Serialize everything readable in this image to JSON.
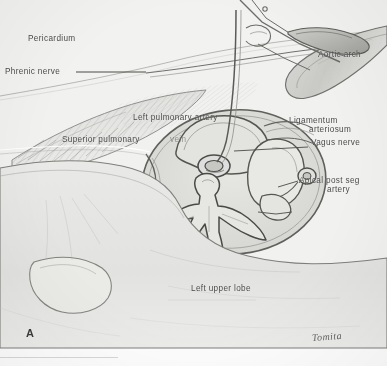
{
  "figure": {
    "panel_letter": "A",
    "signature": "Tomita",
    "medium": "pencil drawing, scanned halftone plate",
    "background_color": "#efefed",
    "ink_color": "#3c3c3c",
    "label_color": "#4a4a4a"
  },
  "labels": [
    {
      "id": "pericardium",
      "text": "Pericardium",
      "x": 28,
      "y": 34
    },
    {
      "id": "phrenic-nerve",
      "text": "Phrenic nerve",
      "x": 5,
      "y": 69
    },
    {
      "id": "aortic-arch",
      "text": "Aortic arch",
      "x": 318,
      "y": 53
    },
    {
      "id": "left-pulmonary-artery",
      "text": "Left pulmonary artery",
      "x": 133,
      "y": 114
    },
    {
      "id": "superior-pulmonary-vein",
      "text": "Superior pulmonary",
      "x": 62,
      "y": 136
    },
    {
      "id": "superior-pulmonary-vein-2",
      "text": "vein",
      "x": 168,
      "y": 136
    },
    {
      "id": "ligamentum-arteriosum-1",
      "text": "Ligamentum",
      "x": 289,
      "y": 117
    },
    {
      "id": "ligamentum-arteriosum-2",
      "text": "arteriosum",
      "x": 307,
      "y": 126
    },
    {
      "id": "vagus-nerve",
      "text": "Vagus nerve",
      "x": 311,
      "y": 139
    },
    {
      "id": "apical-post-seg-artery-1",
      "text": "Apical post seg",
      "x": 299,
      "y": 177
    },
    {
      "id": "apical-post-seg-artery-2",
      "text": "artery",
      "x": 325,
      "y": 186
    },
    {
      "id": "left-upper-lobe",
      "text": "Left upper lobe",
      "x": 191,
      "y": 285
    }
  ],
  "leaders": [
    {
      "id": "phrenic-nerve-leader",
      "from": [
        74,
        73
      ],
      "to": [
        147,
        73
      ]
    },
    {
      "id": "vagus-nerve-leader",
      "from": [
        308,
        147
      ],
      "to": [
        236,
        151
      ]
    },
    {
      "id": "apical-artery-leader",
      "from": [
        298,
        181
      ],
      "to": [
        276,
        188
      ]
    }
  ],
  "structures": [
    {
      "id": "surgical-clamp",
      "name": "surgical clamp / forceps"
    },
    {
      "id": "aortic-arch-vessel",
      "name": "aortic arch"
    },
    {
      "id": "pericardium-surface",
      "name": "pericardium"
    },
    {
      "id": "hilar-window",
      "name": "opened hilar window"
    },
    {
      "id": "pulmonary-artery-trunk",
      "name": "left pulmonary artery"
    },
    {
      "id": "superior-vein",
      "name": "superior pulmonary vein"
    },
    {
      "id": "upper-lobe-mass",
      "name": "left upper lobe"
    },
    {
      "id": "lower-lobe-mass",
      "name": "left lower lobe"
    }
  ]
}
